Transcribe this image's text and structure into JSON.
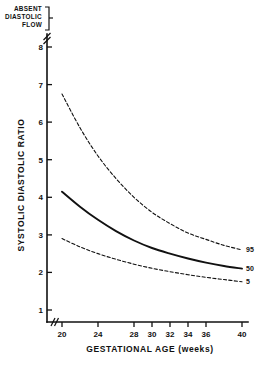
{
  "chart_data": {
    "type": "line",
    "title": "",
    "xlabel": "GESTATIONAL AGE (weeks)",
    "ylabel": "SYSTOLIC DIASTOLIC RATIO",
    "xlim": [
      20,
      40
    ],
    "ylim": [
      1,
      8
    ],
    "grid": false,
    "legend_position": "right-inline",
    "x_ticks": [
      "20",
      "24",
      "28",
      "30",
      "32",
      "34",
      "36",
      "40"
    ],
    "x_tick_values": [
      20,
      24,
      28,
      30,
      32,
      34,
      36,
      40
    ],
    "y_ticks": [
      "1",
      "2",
      "3",
      "4",
      "5",
      "6",
      "7",
      "8"
    ],
    "y_tick_values": [
      1,
      2,
      3,
      4,
      5,
      6,
      7,
      8
    ],
    "x": [
      20,
      22,
      24,
      26,
      28,
      30,
      32,
      34,
      36,
      38,
      40
    ],
    "series": [
      {
        "name": "95",
        "label": "95",
        "style": "dashed",
        "values": [
          6.75,
          5.85,
          5.1,
          4.5,
          4.0,
          3.6,
          3.3,
          3.05,
          2.88,
          2.72,
          2.6
        ]
      },
      {
        "name": "50",
        "label": "50",
        "style": "solid",
        "values": [
          4.15,
          3.75,
          3.4,
          3.1,
          2.85,
          2.65,
          2.5,
          2.37,
          2.26,
          2.17,
          2.1
        ]
      },
      {
        "name": "5",
        "label": "5",
        "style": "dashed",
        "values": [
          2.9,
          2.68,
          2.5,
          2.35,
          2.22,
          2.11,
          2.02,
          1.94,
          1.87,
          1.81,
          1.75
        ]
      }
    ],
    "annotations": [
      {
        "name": "absent-diastolic-flow",
        "text_lines": [
          "ABSENT",
          "DIASTOLIC",
          "FLOW"
        ],
        "position": "above-y-axis-top"
      }
    ],
    "axis_breaks": {
      "y_axis_top": true,
      "x_axis_origin": true
    }
  },
  "annotation": {
    "line1": "ABSENT",
    "line2": "DIASTOLIC",
    "line3": "FLOW"
  },
  "axes": {
    "x_title": "GESTATIONAL AGE (weeks)",
    "y_title": "SYSTOLIC DIASTOLIC RATIO"
  },
  "x_tick_labels": {
    "t0": "20",
    "t1": "24",
    "t2": "28",
    "t3": "30",
    "t4": "32",
    "t5": "34",
    "t6": "36",
    "t7": "40"
  },
  "y_tick_labels": {
    "t0": "1",
    "t1": "2",
    "t2": "3",
    "t3": "4",
    "t4": "5",
    "t5": "6",
    "t6": "7",
    "t7": "8"
  },
  "curve_labels": {
    "p95": "95",
    "p50": "50",
    "p5": "5"
  },
  "colors": {
    "ink": "#111111",
    "background": "#ffffff"
  }
}
